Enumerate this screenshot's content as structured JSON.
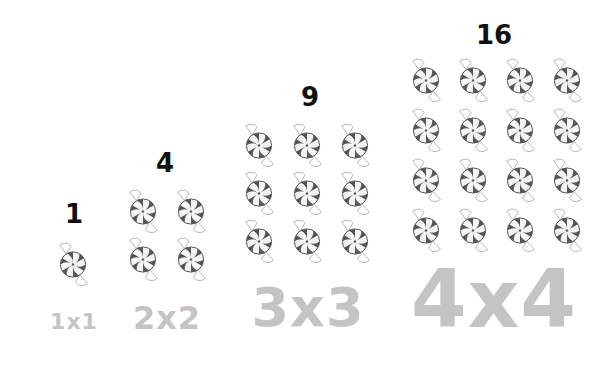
{
  "groups": [
    {
      "count": "1",
      "label": "1x1",
      "grid": 1,
      "countPos": {
        "x": 74,
        "y": 214,
        "size": 26
      },
      "labelPos": {
        "x": 74,
        "y": 322,
        "size": 22
      },
      "candy": {
        "x0": 73,
        "y0": 264,
        "dx": 0,
        "dy": 0,
        "size": 30
      }
    },
    {
      "count": "4",
      "label": "2x2",
      "grid": 2,
      "countPos": {
        "x": 165,
        "y": 163,
        "size": 26
      },
      "labelPos": {
        "x": 167,
        "y": 318,
        "size": 32
      },
      "candy": {
        "x0": 143,
        "y0": 211,
        "dx": 48,
        "dy": 48,
        "size": 30
      }
    },
    {
      "count": "9",
      "label": "3x3",
      "grid": 3,
      "countPos": {
        "x": 310,
        "y": 97,
        "size": 26
      },
      "labelPos": {
        "x": 308,
        "y": 308,
        "size": 54
      },
      "candy": {
        "x0": 259,
        "y0": 145,
        "dx": 48,
        "dy": 48,
        "size": 30
      }
    },
    {
      "count": "16",
      "label": "4x4",
      "grid": 4,
      "countPos": {
        "x": 494,
        "y": 35,
        "size": 26
      },
      "labelPos": {
        "x": 494,
        "y": 300,
        "size": 80
      },
      "candy": {
        "x0": 426,
        "y0": 80,
        "dx": 47,
        "dy": 50,
        "size": 30
      }
    }
  ],
  "colors": {
    "count_text": "#111111",
    "dimension_text": "#c4c4c4",
    "candy_dark": "#555555",
    "candy_light": "#f4f4f4",
    "wrapper": "#999999"
  }
}
